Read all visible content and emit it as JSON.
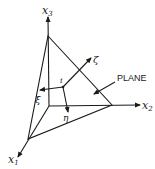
{
  "diagram": {
    "axes": {
      "x1": {
        "label": "x",
        "sub": "1"
      },
      "x2": {
        "label": "x",
        "sub": "2"
      },
      "x3": {
        "label": "x",
        "sub": "3"
      }
    },
    "point": {
      "label": "i"
    },
    "local_axes": {
      "zeta": {
        "label": "ζ"
      },
      "xi": {
        "label": "ξ"
      },
      "eta": {
        "label": "η"
      }
    },
    "plane_label": "PLANE",
    "colors": {
      "stroke": "#1a1a1a",
      "background": "#ffffff"
    }
  }
}
